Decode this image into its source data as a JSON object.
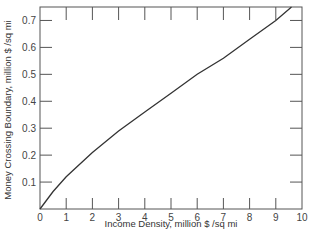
{
  "chart_data": {
    "type": "line",
    "title": "",
    "xlabel": "Income Density, million $ /sq mi",
    "ylabel": "Money Crossing Boundary, million $ /sq mi",
    "xlim": [
      0,
      10
    ],
    "ylim": [
      0,
      0.75
    ],
    "x_ticks": [
      "0",
      "1",
      "2",
      "3",
      "4",
      "5",
      "6",
      "7",
      "8",
      "9",
      "10"
    ],
    "y_ticks": [
      "0",
      "0.1",
      "0.2",
      "0.3",
      "0.4",
      "0.5",
      "0.6",
      "0.7"
    ],
    "grid": false,
    "legend": null,
    "series": [
      {
        "name": "Money crossing boundary",
        "x": [
          0,
          0.5,
          1,
          2,
          3,
          4,
          5,
          6,
          7,
          8,
          9,
          9.6
        ],
        "y": [
          0,
          0.065,
          0.12,
          0.21,
          0.29,
          0.36,
          0.43,
          0.5,
          0.56,
          0.63,
          0.7,
          0.75
        ]
      }
    ]
  },
  "colors": {
    "line": "#333333",
    "axis": "#555555"
  }
}
